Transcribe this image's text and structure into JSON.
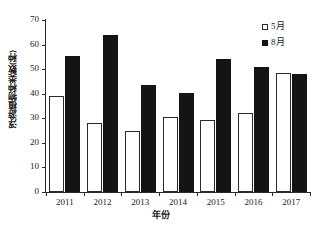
{
  "chart_data": {
    "type": "bar",
    "title": "",
    "xlabel": "年份",
    "ylabel": "浮游植物种类数(种)",
    "categories": [
      "2011",
      "2012",
      "2013",
      "2014",
      "2015",
      "2016",
      "2017"
    ],
    "series": [
      {
        "name": "5月",
        "color": "#ffffff",
        "edge_color": "#2b2b2b",
        "values": [
          39,
          28,
          25,
          30.5,
          29.5,
          32,
          48.5
        ]
      },
      {
        "name": "8月",
        "color": "#141414",
        "edge_color": "#141414",
        "values": [
          55.5,
          64,
          43.5,
          40.5,
          54,
          51,
          48
        ]
      }
    ],
    "ylim": [
      0,
      70
    ],
    "yticks": [
      0,
      10,
      20,
      30,
      40,
      50,
      60,
      70
    ],
    "ytick_labels": [
      "0",
      "10",
      "20",
      "30",
      "40",
      "50",
      "60",
      "70"
    ],
    "xtick_labels": [
      "2011",
      "2012",
      "2013",
      "2014",
      "2015",
      "2016",
      "2017"
    ],
    "grid": false,
    "legend_position": "top-right",
    "legend_entries": [
      "5月",
      "8月"
    ]
  }
}
